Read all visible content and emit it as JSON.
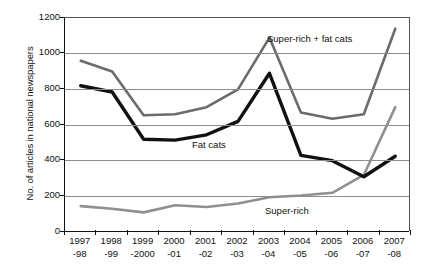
{
  "chart_data": {
    "type": "line",
    "title": "",
    "xlabel": "",
    "ylabel": "No. of articles in national newspapers",
    "ylim": [
      0,
      1200
    ],
    "yticks": [
      0,
      200,
      400,
      600,
      800,
      1000,
      1200
    ],
    "grid": true,
    "legend_position": "inline-annotations",
    "categories": [
      "1997-98",
      "1998-99",
      "1999-2000",
      "2000-01",
      "2001-02",
      "2002-03",
      "2003-04",
      "2004-05",
      "2005-06",
      "2006-07",
      "2007-08"
    ],
    "category_lines": [
      [
        "1997",
        "-98"
      ],
      [
        "1998",
        "-99"
      ],
      [
        "1999",
        "-2000"
      ],
      [
        "2000",
        "-01"
      ],
      [
        "2001",
        "-02"
      ],
      [
        "2002",
        "-03"
      ],
      [
        "2003",
        "-04"
      ],
      [
        "2004",
        "-05"
      ],
      [
        "2005",
        "-06"
      ],
      [
        "2006",
        "-07"
      ],
      [
        "2007",
        "-08"
      ]
    ],
    "series": [
      {
        "name": "Super-rich + fat cats",
        "color": "#6b6b6b",
        "values": [
          960,
          900,
          655,
          660,
          700,
          800,
          1090,
          670,
          635,
          660,
          1140
        ]
      },
      {
        "name": "Fat cats",
        "color": "#111111",
        "values": [
          820,
          785,
          520,
          515,
          545,
          620,
          890,
          430,
          400,
          310,
          425
        ]
      },
      {
        "name": "Super-rich",
        "color": "#909090",
        "values": [
          145,
          130,
          110,
          150,
          140,
          160,
          195,
          205,
          220,
          320,
          700
        ]
      }
    ],
    "annotations": [
      {
        "text": "Super-rich + fat cats",
        "series": "Super-rich + fat cats"
      },
      {
        "text": "Fat cats",
        "series": "Fat cats"
      },
      {
        "text": "Super-rich",
        "series": "Super-rich"
      }
    ]
  },
  "axis": {
    "y_title": "No. of articles in national newspapers",
    "y_ticks": [
      "1200",
      "1000",
      "800",
      "600",
      "400",
      "200",
      "0"
    ]
  }
}
